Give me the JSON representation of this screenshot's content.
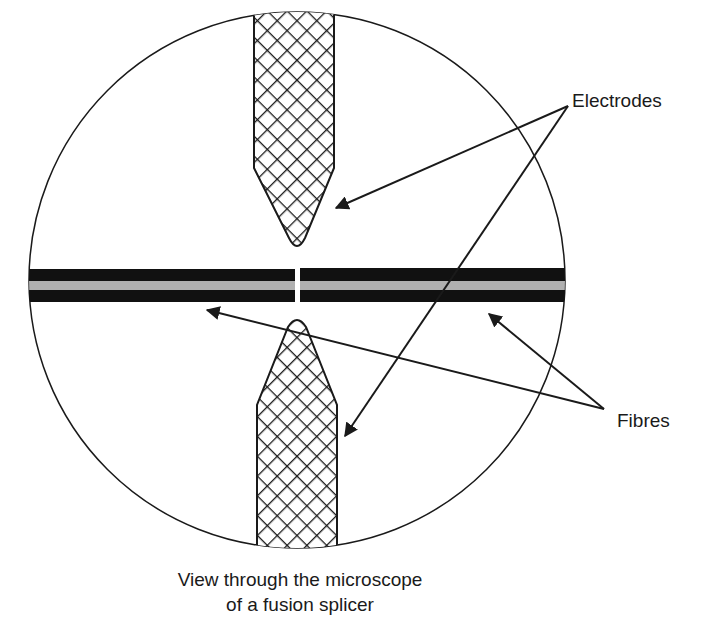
{
  "diagram": {
    "title": "View through the microscope of a fusion splicer",
    "labels": {
      "electrodes": "Electrodes",
      "fibres": "Fibres"
    },
    "caption": {
      "line1": "View through the microscope",
      "line2": "of a fusion splicer"
    },
    "colors": {
      "outline": "#1a1a1a",
      "fibre_cladding": "#111111",
      "fibre_core": "#b0b0b0",
      "background": "#ffffff"
    }
  }
}
